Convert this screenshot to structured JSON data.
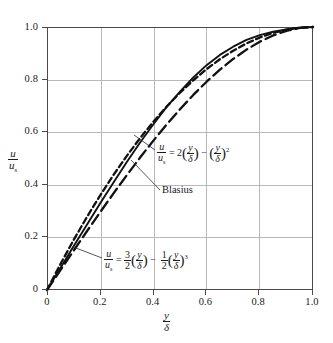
{
  "chart_data": {
    "type": "line",
    "title": "",
    "xlabel": "y/δ",
    "ylabel": "u/uₛ",
    "xlim": [
      0,
      1.0
    ],
    "ylim": [
      0,
      1.0
    ],
    "grid": true,
    "legend_position": "inline-annotations",
    "x_ticks": [
      "0",
      "0.2",
      "0.4",
      "0.6",
      "0.8",
      "1.0"
    ],
    "y_ticks": [
      "0",
      "0.2",
      "0.4",
      "0.6",
      "0.8",
      "1.0"
    ],
    "x": [
      0,
      0.05,
      0.1,
      0.15,
      0.2,
      0.25,
      0.3,
      0.35,
      0.4,
      0.45,
      0.5,
      0.55,
      0.6,
      0.65,
      0.7,
      0.75,
      0.8,
      0.85,
      0.9,
      0.95,
      1.0
    ],
    "series": [
      {
        "name": "parabolic",
        "style": "dashed",
        "label_text": "u/uₛ = 2(y/δ) − (y/δ)²",
        "values": [
          0,
          0.0975,
          0.19,
          0.2775,
          0.36,
          0.4375,
          0.51,
          0.5775,
          0.64,
          0.6975,
          0.75,
          0.7975,
          0.84,
          0.8775,
          0.91,
          0.9375,
          0.96,
          0.9775,
          0.99,
          0.9975,
          1.0
        ]
      },
      {
        "name": "blasius",
        "style": "solid",
        "label_text": "Blasius",
        "values": [
          0,
          0.083,
          0.166,
          0.248,
          0.33,
          0.409,
          0.487,
          0.561,
          0.63,
          0.696,
          0.754,
          0.808,
          0.855,
          0.894,
          0.925,
          0.951,
          0.969,
          0.982,
          0.991,
          0.997,
          1.0
        ]
      },
      {
        "name": "cubic",
        "style": "long-dashed",
        "label_text": "u/uₛ = 3/2(y/δ) − 1/2(y/δ)³",
        "values": [
          0,
          0.0749,
          0.1495,
          0.2233,
          0.296,
          0.3672,
          0.4365,
          0.5036,
          0.568,
          0.6294,
          0.6875,
          0.7418,
          0.792,
          0.8378,
          0.8785,
          0.9141,
          0.944,
          0.9679,
          0.9855,
          0.9964,
          1.0
        ]
      }
    ]
  },
  "axis": {
    "y_title": {
      "num": "u",
      "den_main": "u",
      "den_sub": "s"
    },
    "x_title": {
      "num": "y",
      "den": "δ"
    }
  },
  "annotations": {
    "parabolic": {
      "lhs_num": "u",
      "lhs_den_main": "u",
      "lhs_den_sub": "s",
      "eq": "=",
      "coef": "2",
      "t1_num": "y",
      "t1_den": "δ",
      "minus": "−",
      "t2_num": "y",
      "t2_den": "δ",
      "exp": "2"
    },
    "blasius": {
      "label": "Blasius"
    },
    "cubic": {
      "lhs_num": "u",
      "lhs_den_main": "u",
      "lhs_den_sub": "s",
      "eq": "=",
      "c1_num": "3",
      "c1_den": "2",
      "t1_num": "y",
      "t1_den": "δ",
      "minus": "−",
      "c2_num": "1",
      "c2_den": "2",
      "t2_num": "y",
      "t2_den": "δ",
      "exp": "3"
    }
  },
  "colors": {
    "axis": "#4a4a4a",
    "grid": "#b9b9b9",
    "curve": "#111111",
    "background": "#ffffff"
  }
}
